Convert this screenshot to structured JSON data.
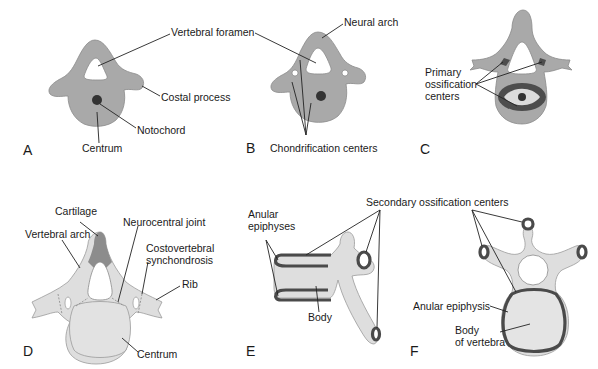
{
  "figure": {
    "panels": [
      {
        "letter": "A",
        "labels": {
          "vertebral_foramen": "Vertebral foramen",
          "costal_process": "Costal process",
          "notochord": "Notochord",
          "centrum": "Centrum"
        }
      },
      {
        "letter": "B",
        "labels": {
          "neural_arch": "Neural arch",
          "chondrification_centers": "Chondrification centers"
        }
      },
      {
        "letter": "C",
        "labels": {
          "primary_ossification_1": "Primary",
          "primary_ossification_2": "ossification",
          "primary_ossification_3": "centers"
        }
      },
      {
        "letter": "D",
        "labels": {
          "cartilage": "Cartilage",
          "vertebral_arch": "Vertebral arch",
          "neurocentral_joint": "Neurocentral joint",
          "costovertebral_1": "Costovertebral",
          "costovertebral_2": "synchondrosis",
          "rib": "Rib",
          "centrum": "Centrum"
        }
      },
      {
        "letter": "E",
        "labels": {
          "anular_1": "Anular",
          "anular_2": "epiphyses",
          "body": "Body"
        }
      },
      {
        "letter": "F",
        "labels": {
          "secondary_ossification": "Secondary ossification centers",
          "anular_epiphysis": "Anular epiphysis",
          "body_1": "Body",
          "body_2": "of vertebra"
        }
      }
    ]
  }
}
